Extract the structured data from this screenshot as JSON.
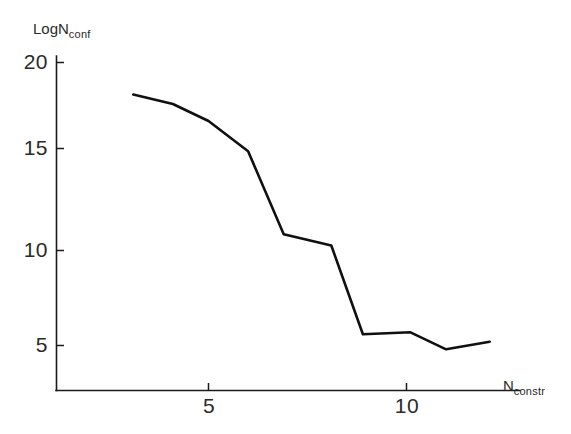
{
  "chart_data": {
    "type": "line",
    "title": "",
    "subtitle": "",
    "xlabel_main": "N",
    "xlabel_sub": "constr",
    "ylabel_main": "LogN",
    "ylabel_sub": "conf",
    "xlabel": "N_constr",
    "ylabel": "LogN_conf",
    "grid": false,
    "legend": "none",
    "xlim": [
      1.2,
      13.2
    ],
    "ylim": [
      2.6,
      20.8
    ],
    "xticks": [
      5,
      10
    ],
    "xtick_labels": [
      "5",
      "10"
    ],
    "yticks": [
      5,
      10,
      15,
      20
    ],
    "ytick_labels": [
      "5",
      "10",
      "15",
      "20"
    ],
    "series": [
      {
        "name": "configurations",
        "x": [
          3.1,
          4.1,
          5.0,
          6.0,
          6.9,
          8.1,
          8.9,
          10.1,
          11.0,
          12.1
        ],
        "y": [
          18.3,
          17.8,
          16.9,
          15.3,
          10.9,
          10.3,
          5.6,
          5.7,
          4.8,
          5.2
        ]
      }
    ],
    "line_color": "#101010",
    "axis_color": "#1b1b1b"
  }
}
